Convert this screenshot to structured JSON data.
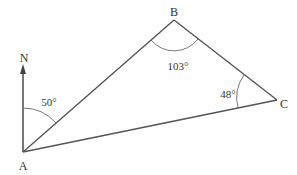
{
  "diagram": {
    "type": "bearing-triangle",
    "colors": {
      "line": "#555555",
      "text": "#333333",
      "background": "#ffffff"
    },
    "vertices": {
      "A": {
        "label": "A",
        "x": 23,
        "y": 152
      },
      "B": {
        "label": "B",
        "x": 174,
        "y": 20
      },
      "C": {
        "label": "C",
        "x": 277,
        "y": 100
      }
    },
    "north": {
      "label": "N"
    },
    "angles": {
      "bearing_at_A": "50°",
      "angle_at_B": "103°",
      "angle_at_C": "48°"
    }
  }
}
